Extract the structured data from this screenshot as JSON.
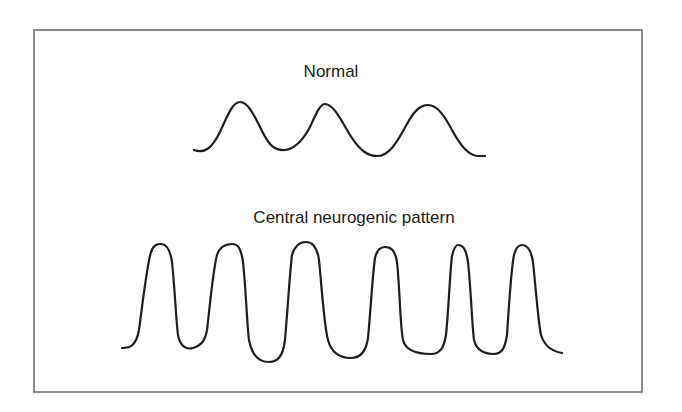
{
  "diagram": {
    "frame_color": "#8a8a8a",
    "line_color": "#1e1e1e",
    "normal": {
      "title": "Normal",
      "description": "Regular, moderate-amplitude sinusoidal breathing waveform",
      "peaks": 3,
      "points": {
        "start": [
          194,
          150
        ],
        "peaks": [
          [
            240,
            102
          ],
          [
            325,
            104
          ],
          [
            428,
            105
          ]
        ],
        "troughs": [
          [
            285,
            150
          ],
          [
            377,
            156
          ]
        ],
        "end": [
          485,
          156
        ]
      }
    },
    "central_neurogenic": {
      "title": "Central neurogenic pattern",
      "description": "Rapid, deep, regular high-amplitude breathing waveform",
      "peaks": 6,
      "points": {
        "start": [
          122,
          348
        ],
        "peaks": [
          [
            161,
            244
          ],
          [
            232,
            244
          ],
          [
            306,
            242
          ],
          [
            385,
            247
          ],
          [
            458,
            245
          ],
          [
            522,
            245
          ]
        ],
        "troughs": [
          [
            193,
            348
          ],
          [
            269,
            362
          ],
          [
            351,
            358
          ],
          [
            431,
            354
          ],
          [
            494,
            354
          ]
        ],
        "end": [
          562,
          353
        ]
      }
    }
  }
}
